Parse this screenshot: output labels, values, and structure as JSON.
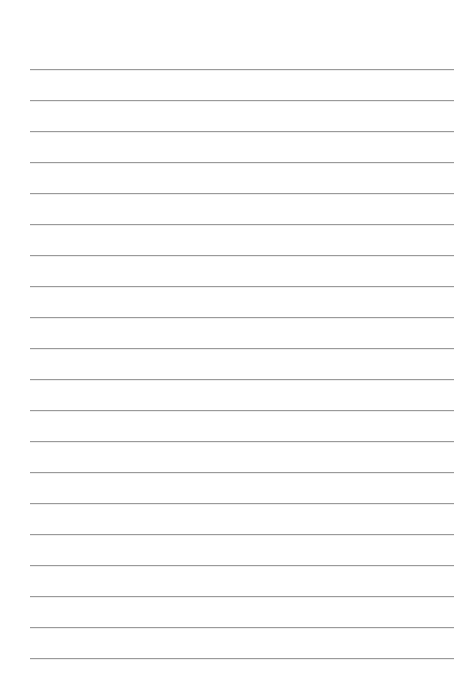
{
  "page": {
    "type": "lined-paper",
    "background_color": "#ffffff",
    "line_color": "#9a9a9a",
    "line_count": 20,
    "first_line_y": 69,
    "line_spacing": 31,
    "line_left": 30,
    "line_right": 454,
    "lines": [
      {
        "text": ""
      },
      {
        "text": ""
      },
      {
        "text": ""
      },
      {
        "text": ""
      },
      {
        "text": ""
      },
      {
        "text": ""
      },
      {
        "text": ""
      },
      {
        "text": ""
      },
      {
        "text": ""
      },
      {
        "text": ""
      },
      {
        "text": ""
      },
      {
        "text": ""
      },
      {
        "text": ""
      },
      {
        "text": ""
      },
      {
        "text": ""
      },
      {
        "text": ""
      },
      {
        "text": ""
      },
      {
        "text": ""
      },
      {
        "text": ""
      },
      {
        "text": ""
      }
    ]
  }
}
